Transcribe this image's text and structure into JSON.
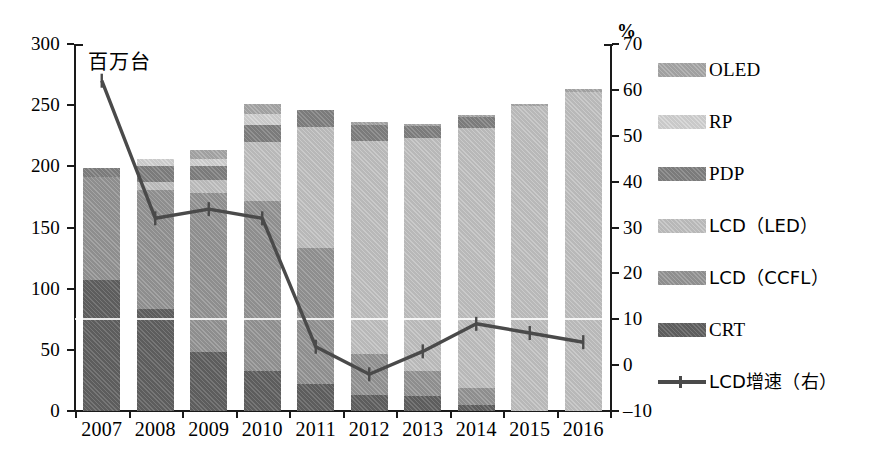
{
  "chart_data": {
    "type": "bar",
    "subtype": "stacked-bar-with-line",
    "title": "",
    "xlabel": "",
    "ylabel": "百万台",
    "y2label": "%",
    "categories": [
      "2007",
      "2008",
      "2009",
      "2010",
      "2011",
      "2012",
      "2013",
      "2014",
      "2015",
      "2016"
    ],
    "ylim": [
      0,
      300
    ],
    "yticks": [
      0,
      50,
      100,
      150,
      200,
      250,
      300
    ],
    "y2lim": [
      -10,
      70
    ],
    "y2ticks": [
      -10,
      0,
      10,
      20,
      30,
      40,
      50,
      60,
      70
    ],
    "grid": false,
    "legend_position": "right",
    "series": [
      {
        "name": "CRT",
        "axis": "left",
        "values": [
          107,
          83,
          48,
          33,
          22,
          13,
          12,
          5,
          0,
          0
        ]
      },
      {
        "name": "LCD（CCFL）",
        "axis": "left",
        "values": [
          84,
          98,
          130,
          139,
          111,
          34,
          21,
          14,
          0,
          0
        ]
      },
      {
        "name": "LCD（LED）",
        "axis": "left",
        "values": [
          0,
          6,
          11,
          48,
          99,
          174,
          190,
          212,
          249,
          261
        ]
      },
      {
        "name": "PDP",
        "axis": "left",
        "values": [
          8,
          13,
          11,
          14,
          14,
          13,
          10,
          9,
          0,
          0
        ]
      },
      {
        "name": "RP",
        "axis": "left",
        "values": [
          0,
          6,
          6,
          9,
          0,
          0,
          0,
          0,
          0,
          0
        ]
      },
      {
        "name": "OLED",
        "axis": "left",
        "values": [
          0,
          0,
          7,
          8,
          0,
          2,
          2,
          2,
          2,
          2
        ]
      },
      {
        "name": "LCD增速（右）",
        "axis": "right",
        "type": "line",
        "values": [
          62,
          32,
          34,
          32,
          4,
          -2,
          3,
          9,
          7,
          5
        ]
      }
    ],
    "totals": [
      199,
      206,
      213,
      251,
      246,
      236,
      235,
      242,
      251,
      263
    ]
  },
  "axes": {
    "left_ticks": [
      "300",
      "250",
      "200",
      "150",
      "100",
      "50",
      "0"
    ],
    "right_ticks": [
      "70",
      "60",
      "50",
      "40",
      "30",
      "20",
      "10",
      "0",
      "–10"
    ],
    "right_unit": "%",
    "left_unit": "百万台",
    "x_ticks": [
      "2007",
      "2008",
      "2009",
      "2010",
      "2011",
      "2012",
      "2013",
      "2014",
      "2015",
      "2016"
    ]
  },
  "legend": {
    "items": [
      {
        "label": "OLED",
        "key": "oled",
        "kind": "swatch"
      },
      {
        "label": "RP",
        "key": "rp",
        "kind": "swatch"
      },
      {
        "label": "PDP",
        "key": "pdp",
        "kind": "swatch"
      },
      {
        "label": "LCD（LED）",
        "key": "led",
        "kind": "swatch"
      },
      {
        "label": "LCD（CCFL）",
        "key": "ccfl",
        "kind": "swatch"
      },
      {
        "label": "CRT",
        "key": "crt",
        "kind": "swatch"
      },
      {
        "label": "LCD增速（右）",
        "key": "line",
        "kind": "line"
      }
    ]
  },
  "colors": {
    "crt": "#5d5d5d",
    "ccfl": "#8e8e8e",
    "led": "#b8b8b8",
    "pdp": "#7b7b7b",
    "rp": "#c9c9c9",
    "oled": "#a0a0a0",
    "line": "#4a4a4a",
    "axis": "#1a1a1a",
    "background": "#ffffff"
  }
}
